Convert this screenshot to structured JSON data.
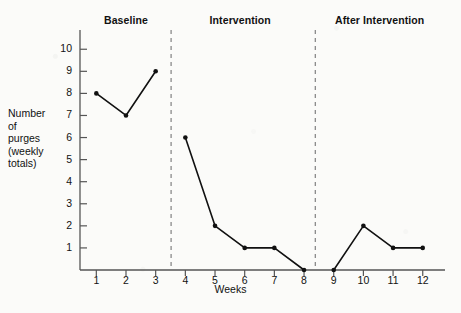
{
  "chart_data": {
    "type": "line",
    "title": "",
    "xlabel": "Weeks",
    "ylabel": "Number of purges (weekly totals)",
    "ylabel_lines": [
      "Number",
      "of",
      "purges",
      "(weekly",
      "totals)"
    ],
    "x": [
      1,
      2,
      3,
      4,
      5,
      6,
      7,
      8,
      9,
      10,
      11,
      12
    ],
    "values": [
      8,
      7,
      9,
      6,
      2,
      1,
      1,
      0,
      0,
      2,
      1,
      1
    ],
    "categories": [
      "1",
      "2",
      "3",
      "4",
      "5",
      "6",
      "7",
      "8",
      "9",
      "10",
      "11",
      "12"
    ],
    "xtick_labels": [
      "1",
      "2",
      "3",
      "4",
      "5",
      "6",
      "7",
      "8",
      "9",
      "10",
      "11",
      "12"
    ],
    "ytick_labels": [
      "1",
      "2",
      "3",
      "4",
      "5",
      "6",
      "7",
      "8",
      "9",
      "10"
    ],
    "ytick_values": [
      1,
      2,
      3,
      4,
      5,
      6,
      7,
      8,
      9,
      10
    ],
    "ylim": [
      0,
      10.6
    ],
    "xlim": [
      0.45,
      12.75
    ],
    "grid": false,
    "legend": null,
    "marker": "filled-circle",
    "line_color": "#111111",
    "segments": [
      {
        "phase": "Baseline",
        "x": [
          1,
          2,
          3
        ],
        "values": [
          8,
          7,
          9
        ]
      },
      {
        "phase": "Intervention",
        "x": [
          4,
          5,
          6,
          7,
          8
        ],
        "values": [
          6,
          2,
          1,
          1,
          0
        ]
      },
      {
        "phase": "After Intervention",
        "x": [
          9,
          10,
          11,
          12
        ],
        "values": [
          0,
          2,
          1,
          1
        ]
      }
    ],
    "annotations": [
      {
        "type": "phase-label",
        "text": "Baseline",
        "x_center": 2.0
      },
      {
        "type": "phase-label",
        "text": "Intervention",
        "x_center": 5.85
      },
      {
        "type": "phase-label",
        "text": "After Intervention",
        "x_center": 10.55
      },
      {
        "type": "divider",
        "label": "phase-divider-1",
        "x": 3.52,
        "style": "dashed"
      },
      {
        "type": "divider",
        "label": "phase-divider-2",
        "x": 8.38,
        "style": "dashed"
      }
    ]
  },
  "phases": [
    {
      "label": "Baseline"
    },
    {
      "label": "Intervention"
    },
    {
      "label": "After Intervention"
    }
  ],
  "axes": {
    "x_title": "Weeks",
    "y_title_lines": [
      "Number",
      "of",
      "purges",
      "(weekly",
      "totals)"
    ]
  },
  "colors": {
    "line": "#111111",
    "axis": "#555555",
    "divider": "#8a8a8a",
    "background": "#fbfbf9",
    "text": "#111111"
  }
}
